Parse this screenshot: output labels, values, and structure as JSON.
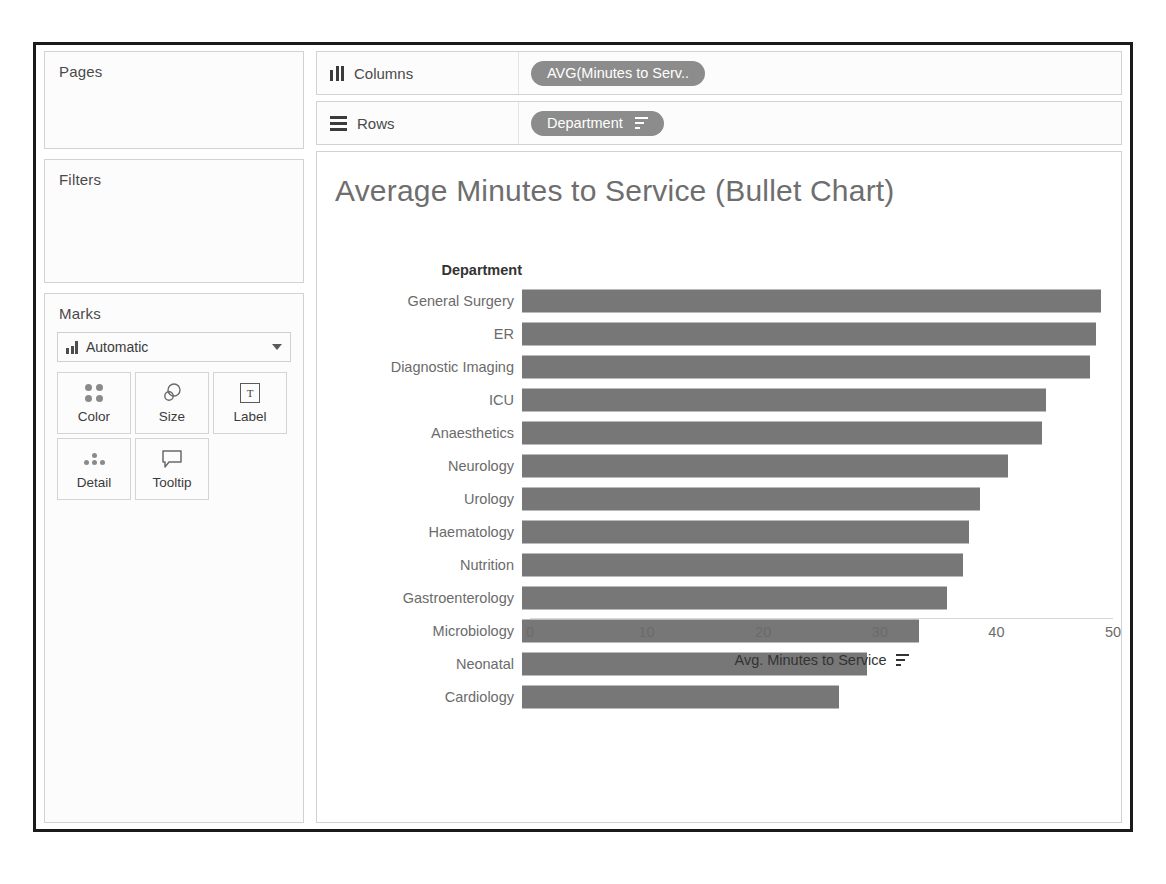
{
  "shelves": {
    "pages_label": "Pages",
    "filters_label": "Filters",
    "marks_label": "Marks",
    "columns_label": "Columns",
    "rows_label": "Rows",
    "columns_pill": "AVG(Minutes to Serv..",
    "rows_pill": "Department",
    "columns_icon": "columns-icon",
    "rows_icon": "rows-icon"
  },
  "marks": {
    "type_label": "Automatic",
    "type_icon": "bar-mark-icon",
    "dropdown_icon": "chevron-down-icon",
    "buttons": [
      {
        "label": "Color",
        "icon": "color-dots-icon"
      },
      {
        "label": "Size",
        "icon": "size-circles-icon"
      },
      {
        "label": "Label",
        "icon": "label-text-icon"
      },
      {
        "label": "Detail",
        "icon": "detail-dots-icon"
      },
      {
        "label": "Tooltip",
        "icon": "tooltip-bubble-icon"
      }
    ]
  },
  "view": {
    "title": "Average Minutes to Service (Bullet Chart)",
    "row_header": "Department",
    "axis_sort_icon": "sort-descending-icon"
  },
  "chart_data": {
    "type": "bar",
    "orientation": "horizontal",
    "title": "Average Minutes to Service (Bullet Chart)",
    "xlabel": "Avg. Minutes to Service",
    "ylabel": "Department",
    "xlim": [
      0,
      50
    ],
    "xticks": [
      0,
      10,
      20,
      30,
      40,
      50
    ],
    "grid": false,
    "legend": "none",
    "bar_color": "#777777",
    "categories": [
      "General Surgery",
      "ER",
      "Diagnostic Imaging",
      "ICU",
      "Anaesthetics",
      "Neurology",
      "Urology",
      "Haematology",
      "Nutrition",
      "Gastroenterology",
      "Microbiology",
      "Neonatal",
      "Cardiology"
    ],
    "values": [
      48.3,
      47.9,
      47.4,
      43.7,
      43.4,
      40.6,
      38.2,
      37.3,
      36.8,
      35.5,
      33.1,
      28.8,
      26.5
    ]
  }
}
